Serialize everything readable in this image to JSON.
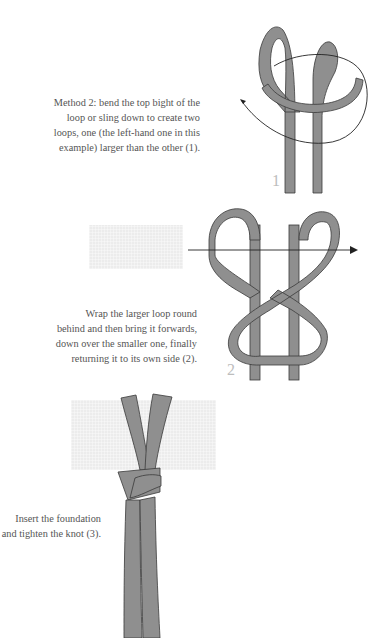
{
  "steps": [
    {
      "number": "1",
      "caption": "Method 2: bend the top bight of the\nloop or sling down to create two\nloops, one (the left-hand one in this\nexample) larger than the other (1)."
    },
    {
      "number": "2",
      "caption": "Wrap the larger loop round\nbehind and then bring it forwards,\ndown over the smaller one, finally\nreturning it to its own side (2)."
    },
    {
      "number": "3",
      "caption": "Insert the foundation\nand tighten the knot (3)."
    }
  ],
  "colors": {
    "strap": "#8f8f8f",
    "strap_edge": "#3a3a3a",
    "arrow": "#222222",
    "foundation": "#ececec",
    "caption_text": "#555555",
    "step_number": "#bdbdbd"
  }
}
